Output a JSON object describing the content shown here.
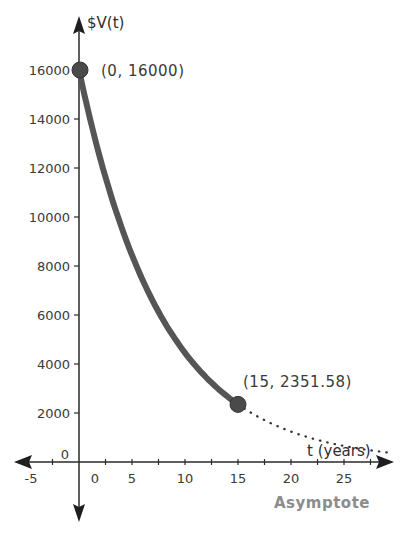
{
  "chart_data": {
    "type": "line",
    "title": "",
    "xlabel": "t (years)",
    "ylabel": "$V(t)",
    "xlim": [
      -5,
      29
    ],
    "ylim": [
      -2300,
      17500
    ],
    "grid": false,
    "legend": null,
    "x_ticks": [
      -5,
      0,
      5,
      10,
      15,
      20,
      25
    ],
    "x_tick_labels": [
      "-5",
      "0",
      "5",
      "10",
      "15",
      "20",
      "25"
    ],
    "y_ticks": [
      0,
      2000,
      4000,
      6000,
      8000,
      10000,
      12000,
      14000,
      16000
    ],
    "y_tick_labels": [
      "0",
      "2000",
      "4000",
      "6000",
      "8000",
      "10000",
      "12000",
      "14000",
      "16000"
    ],
    "function": "V(t) = 16000 * (2351.58/16000)^(t/15)",
    "series": [
      {
        "name": "V(t) solid",
        "style": "solid",
        "color": "#555555",
        "x": [
          0,
          1,
          2,
          3,
          4,
          5,
          6,
          7,
          8,
          9,
          10,
          11,
          12,
          13,
          14,
          15
        ],
        "values": [
          16000,
          14100,
          12425,
          10950,
          9650,
          8504,
          7494,
          6604,
          5820,
          5129,
          4520,
          3983,
          3510,
          3093,
          2726,
          2351.58
        ]
      },
      {
        "name": "V(t) extension",
        "style": "dotted",
        "color": "#333333",
        "x": [
          15,
          17.5,
          20,
          22.5,
          25,
          27.5,
          30
        ],
        "values": [
          2351.58,
          1865,
          1478,
          1172,
          929,
          737,
          584
        ]
      }
    ],
    "points": [
      {
        "x": 0,
        "y": 16000,
        "label": "(0, 16000)"
      },
      {
        "x": 15,
        "y": 2351.58,
        "label": "(15, 2351.58)"
      }
    ],
    "annotations": [
      "Asymptote"
    ]
  },
  "labels": {
    "y_axis": "$V(t)",
    "x_axis": "t (years)",
    "point_a": "(0, 16000)",
    "point_b": "(15, 2351.58)",
    "asymptote": "Asymptote",
    "x_ticks": [
      "-5",
      "0",
      "5",
      "10",
      "15",
      "20",
      "25"
    ],
    "y_ticks": [
      "0",
      "2000",
      "4000",
      "6000",
      "8000",
      "10000",
      "12000",
      "14000",
      "16000"
    ]
  },
  "colors": {
    "curve": "#555555",
    "point_fill": "#4a4a4a",
    "axis": "#2a2a2a",
    "annotation": "#8c8c8c"
  }
}
